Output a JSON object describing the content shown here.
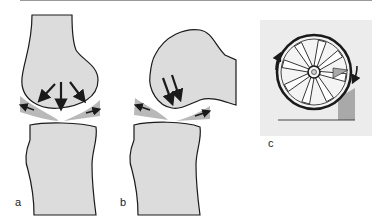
{
  "figure": {
    "panels": [
      {
        "id": "a",
        "label": "a",
        "description": "Extended knee: femoral condyle presses down (three arrows), menisci pushed outward (arrows)"
      },
      {
        "id": "b",
        "label": "b",
        "description": "Flexed knee: femoral condyle rolls, two downward arrows, menisci pushed outward"
      },
      {
        "id": "c",
        "label": "c",
        "description": "Wheel with wedge (chock) analogy, rotation arrows on rim"
      }
    ],
    "colors": {
      "bone_fill": "#dcdcdc",
      "meniscus_fill": "#b9b9b9",
      "outline": "#1a1a1a",
      "panel_c_bg": "#ececec",
      "wedge": "#a9a9a9"
    }
  }
}
